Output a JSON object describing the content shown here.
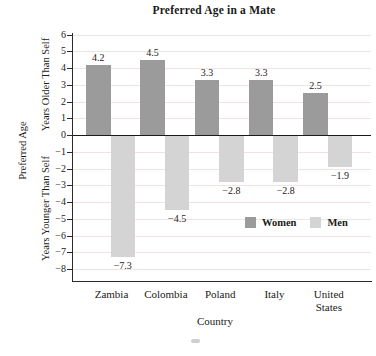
{
  "title": "Preferred Age in a Mate",
  "axes": {
    "x_label": "Country",
    "y_label_outer": "Preferred Age",
    "y_label_upper": "Years Older Than Self",
    "y_label_lower": "Years Younger Than Self"
  },
  "legend": {
    "items": [
      {
        "label": "Women",
        "color": "#9b9b9b"
      },
      {
        "label": "Men",
        "color": "#d4d4d4"
      }
    ]
  },
  "chart_data": {
    "type": "bar",
    "categories": [
      "Zambia",
      "Colombia",
      "Poland",
      "Italy",
      "United States"
    ],
    "series": [
      {
        "name": "Women",
        "color": "#9b9b9b",
        "values": [
          4.2,
          4.5,
          3.3,
          3.3,
          2.5
        ]
      },
      {
        "name": "Men",
        "color": "#d4d4d4",
        "values": [
          -7.3,
          -4.5,
          -2.8,
          -2.8,
          -1.9
        ]
      }
    ],
    "title": "Preferred Age in a Mate",
    "xlabel": "Country",
    "ylabel": "Preferred Age",
    "ylim": [
      -8,
      6
    ],
    "ytick_step": 1,
    "yticks": [
      6,
      5,
      4,
      3,
      2,
      1,
      0,
      -1,
      -2,
      -3,
      -4,
      -5,
      -6,
      -7,
      -8
    ],
    "grid": true,
    "gridline_color": "#f0e3e1",
    "zero_line_color": "#1a1a1a",
    "data_labels": true,
    "legend_position": "inside lower-right"
  },
  "colors": {
    "background": "#ffffff",
    "women_bar": "#9b9b9b",
    "men_bar": "#d4d4d4",
    "gridline": "#f0e3e1",
    "axis": "#2b2b2b",
    "text": "#1a1a1a"
  }
}
